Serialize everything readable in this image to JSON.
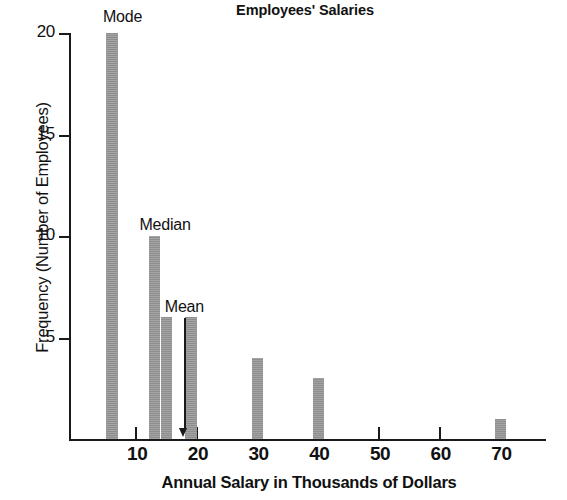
{
  "chart_data": {
    "type": "bar",
    "title": "Employees' Salaries",
    "xlabel": "Annual Salary in Thousands of Dollars",
    "ylabel": "Frequency (Number of Employees)",
    "x": [
      6,
      13,
      15,
      19,
      30,
      40,
      70
    ],
    "values": [
      20,
      10,
      6,
      6,
      4,
      3,
      1
    ],
    "categories": [
      "6",
      "13",
      "15",
      "19",
      "30",
      "40",
      "70"
    ],
    "xlim": [
      0,
      78
    ],
    "ylim": [
      0,
      20
    ],
    "xticks": [
      10,
      20,
      30,
      40,
      50,
      60,
      70
    ],
    "xtick_labels": [
      "10",
      "20",
      "30",
      "40",
      "50",
      "60",
      "70"
    ],
    "yticks": [
      5,
      10,
      15,
      20
    ],
    "ytick_labels": [
      "5",
      "10",
      "15",
      "20"
    ],
    "grid": false,
    "legend": "none",
    "bar_color": "#979797",
    "axis_color": "#1a1a1a",
    "annotations": [
      {
        "label": "Mode",
        "x": 6,
        "y": 20,
        "arrow": false
      },
      {
        "label": "Median",
        "x": 13,
        "y": 10,
        "arrow": false
      },
      {
        "label": "Mean",
        "x": 18,
        "y": 0,
        "arrow": true
      }
    ]
  }
}
